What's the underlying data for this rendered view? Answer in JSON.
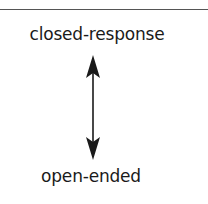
{
  "diagram": {
    "type": "continuum",
    "top_label": "closed-response",
    "bottom_label": "open-ended",
    "connector": "double-headed-vertical-arrow",
    "colors": {
      "text": "#1a1a1a",
      "arrow": "#1a1a1a",
      "rule": "#555555",
      "background": "#ffffff"
    }
  }
}
